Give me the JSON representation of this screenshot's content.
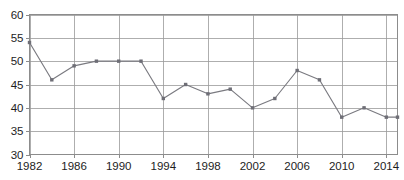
{
  "chart_data": {
    "type": "line",
    "title": "",
    "xlabel": "",
    "ylabel": "",
    "xlim": [
      1982,
      2015
    ],
    "ylim": [
      30,
      60
    ],
    "grid": true,
    "legend": null,
    "x_ticks": [
      1982,
      1986,
      1990,
      1994,
      1998,
      2002,
      2006,
      2010,
      2014
    ],
    "y_ticks": [
      30,
      35,
      40,
      45,
      50,
      55,
      60
    ],
    "x_tick_labels": [
      "1982",
      "1986",
      "1990",
      "1994",
      "1998",
      "2002",
      "2006",
      "2010",
      "2014"
    ],
    "y_tick_labels": [
      "30",
      "35",
      "40",
      "45",
      "50",
      "55",
      "60"
    ],
    "marker": "square",
    "marker_color": "#6e6e76",
    "line_color": "#7a7a80",
    "grid_color": "#9a9a9a",
    "series": [
      {
        "name": "series-1",
        "x": [
          1982,
          1984,
          1986,
          1988,
          1990,
          1992,
          1994,
          1996,
          1998,
          2000,
          2002,
          2004,
          2006,
          2008,
          2010,
          2012,
          2014,
          2015
        ],
        "values": [
          54,
          46,
          49,
          50,
          50,
          50,
          42,
          45,
          43,
          44,
          40,
          42,
          48,
          46,
          38,
          40,
          38,
          38
        ]
      }
    ],
    "points": [
      {
        "x": 1982,
        "y": 54
      },
      {
        "x": 1984,
        "y": 46
      },
      {
        "x": 1986,
        "y": 49
      },
      {
        "x": 1988,
        "y": 50
      },
      {
        "x": 1990,
        "y": 50
      },
      {
        "x": 1992,
        "y": 50
      },
      {
        "x": 1994,
        "y": 42
      },
      {
        "x": 1996,
        "y": 45
      },
      {
        "x": 1998,
        "y": 43
      },
      {
        "x": 2000,
        "y": 44
      },
      {
        "x": 2002,
        "y": 40
      },
      {
        "x": 2004,
        "y": 42
      },
      {
        "x": 2006,
        "y": 48
      },
      {
        "x": 2008,
        "y": 46
      },
      {
        "x": 2010,
        "y": 38
      },
      {
        "x": 2012,
        "y": 40
      },
      {
        "x": 2014,
        "y": 38
      },
      {
        "x": 2015,
        "y": 38
      }
    ]
  }
}
